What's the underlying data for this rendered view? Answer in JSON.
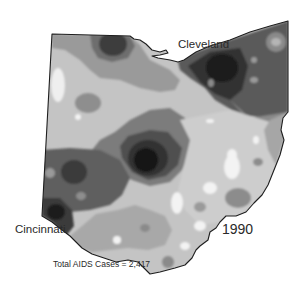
{
  "map": {
    "region": "Ohio",
    "year": "1990",
    "total_label": "Total AIDS Cases = 2,417",
    "cities": [
      {
        "name": "Cleveland"
      },
      {
        "name": "Cincinnati"
      }
    ],
    "shading": {
      "scale": "grayscale density contours",
      "levels": [
        "#f2f2f2",
        "#d6d6d6",
        "#bdbdbd",
        "#9e9e9e",
        "#7e7e7e",
        "#5e5e5e",
        "#3c3c3c",
        "#1c1c1c"
      ]
    },
    "outline_color": "#1e1e1e"
  }
}
